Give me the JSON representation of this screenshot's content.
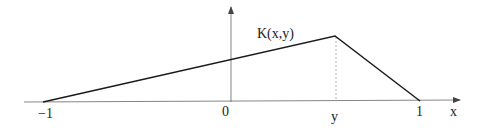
{
  "diagram": {
    "function_label": "K(x,y)",
    "x_axis_label": "x",
    "ticks": {
      "left": "−1",
      "origin": "0",
      "peak": "y",
      "right": "1"
    },
    "colors": {
      "axis": "#555555",
      "curve": "#1a1a1a",
      "dashed": "#9a9a9a",
      "text": "#222222"
    }
  }
}
